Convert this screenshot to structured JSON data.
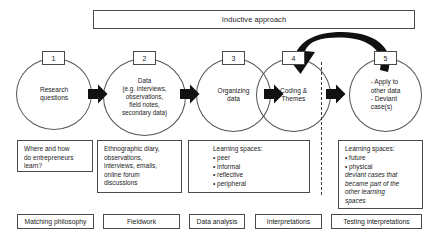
{
  "diagram": {
    "banner": {
      "label": "Inductive approach"
    },
    "stages": [
      {
        "number": "1",
        "label": "Research\nquestions"
      },
      {
        "number": "2",
        "label": "Data\n(e.g. interviews,\nobservations,\nfield notes,\nsecondary data)"
      },
      {
        "number": "3",
        "label": "Organizing\ndata"
      },
      {
        "number": "4",
        "label": "Coding &\nThemes"
      },
      {
        "number": "5",
        "label": "- Apply to\n  other data\n- Deviant\n  case(s)"
      }
    ],
    "notes": [
      {
        "name": "note-research-question",
        "text": "Where and how\ndo entrepreneurs\nlearn?"
      },
      {
        "name": "note-data-sources",
        "text": "Ethnographic diary,\nobservations,\ninterviews, emails,\nonline forum\ndiscussions"
      }
    ],
    "learning_spaces_middle": {
      "heading": "Learning spaces:",
      "bullets": "• peer\n• informal\n• reflective\n• peripheral"
    },
    "learning_spaces_right": {
      "heading": "Learning spaces:",
      "bullets": "• future\n• physical",
      "italic": "deviant cases that\nbecame part of the\nother learning\nspaces"
    },
    "phases": [
      {
        "label": "Matching philosophy"
      },
      {
        "label": "Fieldwork"
      },
      {
        "label": "Data analysis"
      },
      {
        "label": "Interpretations"
      },
      {
        "label": "Testing interpretations"
      }
    ]
  }
}
